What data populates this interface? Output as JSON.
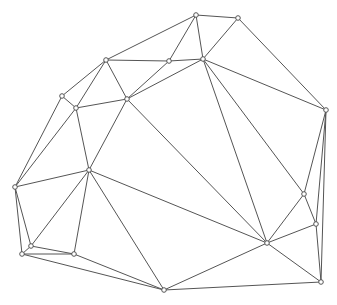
{
  "diagram": {
    "type": "triangulation-mesh",
    "colors": {
      "background": "#ffffff",
      "edge": "#555555",
      "node_fill": "#ffffff",
      "node_stroke": "#555555"
    },
    "nodes": [
      {
        "id": "A",
        "x": 196,
        "y": 15
      },
      {
        "id": "B",
        "x": 238,
        "y": 18
      },
      {
        "id": "C",
        "x": 106,
        "y": 60
      },
      {
        "id": "D",
        "x": 169,
        "y": 61
      },
      {
        "id": "E",
        "x": 203,
        "y": 59
      },
      {
        "id": "F",
        "x": 62,
        "y": 96
      },
      {
        "id": "G",
        "x": 76,
        "y": 108
      },
      {
        "id": "H",
        "x": 127,
        "y": 99
      },
      {
        "id": "I",
        "x": 326,
        "y": 110
      },
      {
        "id": "J",
        "x": 89,
        "y": 170
      },
      {
        "id": "K",
        "x": 15,
        "y": 187
      },
      {
        "id": "L",
        "x": 304,
        "y": 194
      },
      {
        "id": "M",
        "x": 316,
        "y": 224
      },
      {
        "id": "N",
        "x": 267,
        "y": 243
      },
      {
        "id": "O",
        "x": 31,
        "y": 246
      },
      {
        "id": "P",
        "x": 22,
        "y": 254
      },
      {
        "id": "Q",
        "x": 74,
        "y": 254
      },
      {
        "id": "R",
        "x": 321,
        "y": 282
      },
      {
        "id": "S",
        "x": 164,
        "y": 290
      }
    ],
    "edges": [
      [
        "A",
        "B"
      ],
      [
        "A",
        "C"
      ],
      [
        "A",
        "D"
      ],
      [
        "A",
        "E"
      ],
      [
        "B",
        "E"
      ],
      [
        "B",
        "I"
      ],
      [
        "C",
        "D"
      ],
      [
        "C",
        "F"
      ],
      [
        "C",
        "G"
      ],
      [
        "C",
        "H"
      ],
      [
        "D",
        "E"
      ],
      [
        "D",
        "H"
      ],
      [
        "E",
        "H"
      ],
      [
        "E",
        "I"
      ],
      [
        "E",
        "N"
      ],
      [
        "E",
        "L"
      ],
      [
        "H",
        "G"
      ],
      [
        "H",
        "J"
      ],
      [
        "H",
        "N"
      ],
      [
        "F",
        "G"
      ],
      [
        "F",
        "K"
      ],
      [
        "G",
        "J"
      ],
      [
        "G",
        "K"
      ],
      [
        "I",
        "L"
      ],
      [
        "I",
        "M"
      ],
      [
        "I",
        "R"
      ],
      [
        "J",
        "K"
      ],
      [
        "J",
        "N"
      ],
      [
        "J",
        "O"
      ],
      [
        "J",
        "Q"
      ],
      [
        "J",
        "S"
      ],
      [
        "K",
        "O"
      ],
      [
        "K",
        "P"
      ],
      [
        "L",
        "N"
      ],
      [
        "L",
        "M"
      ],
      [
        "M",
        "N"
      ],
      [
        "M",
        "R"
      ],
      [
        "N",
        "R"
      ],
      [
        "N",
        "S"
      ],
      [
        "O",
        "Q"
      ],
      [
        "P",
        "Q"
      ],
      [
        "O",
        "P"
      ],
      [
        "P",
        "S"
      ],
      [
        "S",
        "R"
      ],
      [
        "Q",
        "S"
      ]
    ]
  }
}
